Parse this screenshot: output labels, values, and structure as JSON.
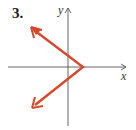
{
  "problem": {
    "number_label": "3."
  },
  "axes": {
    "x_label": "x",
    "y_label": "y",
    "axis_color": "#555555"
  },
  "graph": {
    "shape": "V opening left (arrows on both arms)",
    "color": "#d9472b",
    "vertex_px": [
      83,
      67
    ],
    "upper_arm_end_px": [
      32,
      28
    ],
    "lower_arm_end_px": [
      33,
      107
    ]
  }
}
